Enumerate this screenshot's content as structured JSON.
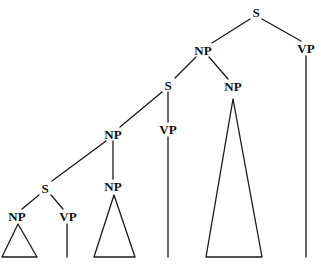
{
  "diagram": {
    "type": "syntax-tree",
    "stroke_color": "#1a1a1a",
    "background_color": "#ffffff",
    "nodes": [
      {
        "id": "s-root",
        "label": "S",
        "x": 256,
        "y": 12
      },
      {
        "id": "np-1",
        "label": "NP",
        "x": 203,
        "y": 50
      },
      {
        "id": "vp-right",
        "label": "VP",
        "x": 306,
        "y": 48
      },
      {
        "id": "s-2",
        "label": "S",
        "x": 168,
        "y": 85
      },
      {
        "id": "np-big",
        "label": "NP",
        "x": 233,
        "y": 86
      },
      {
        "id": "np-2",
        "label": "NP",
        "x": 113,
        "y": 134
      },
      {
        "id": "vp-mid",
        "label": "VP",
        "x": 168,
        "y": 129
      },
      {
        "id": "s-3",
        "label": "S",
        "x": 45,
        "y": 188
      },
      {
        "id": "np-3",
        "label": "NP",
        "x": 113,
        "y": 186
      },
      {
        "id": "np-leaf",
        "label": "NP",
        "x": 17,
        "y": 216
      },
      {
        "id": "vp-leaf",
        "label": "VP",
        "x": 68,
        "y": 216
      }
    ],
    "edges": [
      {
        "id": "edge-sroot-np1",
        "from": "s-root",
        "to": "np-1",
        "x1": 250,
        "y1": 19,
        "x2": 212,
        "y2": 43
      },
      {
        "id": "edge-sroot-vpr",
        "from": "s-root",
        "to": "vp-right",
        "x1": 262,
        "y1": 19,
        "x2": 301,
        "y2": 41
      },
      {
        "id": "edge-np1-s2",
        "from": "np-1",
        "to": "s-2",
        "x1": 196,
        "y1": 57,
        "x2": 175,
        "y2": 78
      },
      {
        "id": "edge-np1-npbig",
        "from": "np-1",
        "to": "np-big",
        "x1": 209,
        "y1": 57,
        "x2": 228,
        "y2": 79
      },
      {
        "id": "edge-s2-np2",
        "from": "s-2",
        "to": "np-2",
        "x1": 162,
        "y1": 92,
        "x2": 120,
        "y2": 127
      },
      {
        "id": "edge-s2-vpmid",
        "from": "s-2",
        "to": "vp-mid",
        "x1": 168,
        "y1": 92,
        "x2": 168,
        "y2": 122
      },
      {
        "id": "edge-np2-s3",
        "from": "np-2",
        "to": "s-3",
        "x1": 106,
        "y1": 141,
        "x2": 52,
        "y2": 181
      },
      {
        "id": "edge-np2-np3",
        "from": "np-2",
        "to": "np-3",
        "x1": 113,
        "y1": 141,
        "x2": 113,
        "y2": 179
      },
      {
        "id": "edge-s3-npleaf",
        "from": "s-3",
        "to": "np-leaf",
        "x1": 39,
        "y1": 195,
        "x2": 22,
        "y2": 209
      },
      {
        "id": "edge-s3-vpleaf",
        "from": "s-3",
        "to": "vp-leaf",
        "x1": 51,
        "y1": 195,
        "x2": 63,
        "y2": 209
      },
      {
        "id": "edge-vpleaf-stem",
        "from": "vp-leaf",
        "to": "baseline",
        "x1": 67,
        "y1": 224,
        "x2": 67,
        "y2": 257
      },
      {
        "id": "edge-vpmid-stem",
        "from": "vp-mid",
        "to": "baseline",
        "x1": 168,
        "y1": 137,
        "x2": 168,
        "y2": 257
      },
      {
        "id": "edge-vpright-stem",
        "from": "vp-right",
        "to": "baseline",
        "x1": 306,
        "y1": 56,
        "x2": 306,
        "y2": 257
      }
    ],
    "triangles": [
      {
        "id": "triangle-np-leaf",
        "under": "np-leaf",
        "apex_x": 18,
        "apex_y": 224,
        "left_x": 2,
        "right_x": 37,
        "base_y": 257
      },
      {
        "id": "triangle-np-3",
        "under": "np-3",
        "apex_x": 114,
        "apex_y": 195,
        "left_x": 94,
        "right_x": 135,
        "base_y": 257
      },
      {
        "id": "triangle-np-big",
        "under": "np-big",
        "apex_x": 233,
        "apex_y": 99,
        "left_x": 206,
        "right_x": 262,
        "base_y": 257
      }
    ]
  }
}
